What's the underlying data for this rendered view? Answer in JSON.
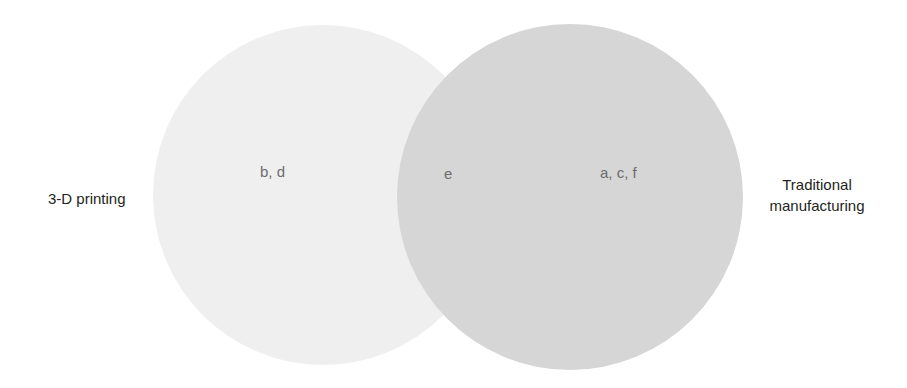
{
  "diagram": {
    "type": "venn",
    "sets": [
      {
        "id": "left",
        "label": "3-D printing",
        "fill": "#efefef",
        "center": [
          323,
          195
        ],
        "radius": 170
      },
      {
        "id": "right",
        "label_line1": "Traditional",
        "label_line2": "manufacturing",
        "fill": "#d6d6d6",
        "center": [
          570,
          197
        ],
        "radius": 173
      }
    ],
    "regions": {
      "left_only": "b, d",
      "intersection": "e",
      "right_only": "a, c, f"
    },
    "colors": {
      "background": "#ffffff",
      "left_circle": "#efefef",
      "right_circle": "#d6d6d6",
      "set_label_text": "#231f20",
      "region_label_text": "#6d6d6d"
    }
  }
}
